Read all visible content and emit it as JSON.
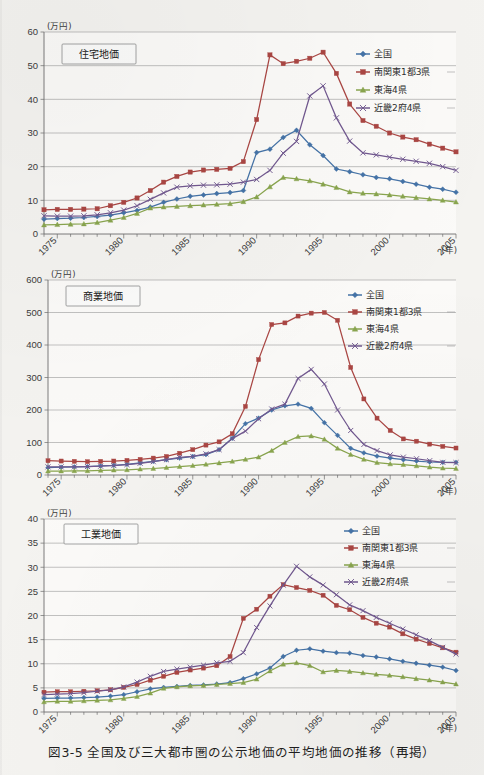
{
  "caption": "図3-5 全国及び三大都市圏の公示地価の平均地価の推移（再掲）",
  "axis_unit_y": "(万円)",
  "axis_unit_x": "(年)",
  "series_names": [
    "全国",
    "南関東1都3県",
    "東海4県",
    "近畿2府4県"
  ],
  "colors": {
    "zenkoku": "#4573a7",
    "minami_kanto": "#aa4643",
    "tokai": "#89a54e",
    "kinki": "#71588f",
    "grid": "#9a9a9a",
    "axis": "#6d6d6d",
    "paper": "#f4f3f0"
  },
  "legend": {
    "items": [
      {
        "label": "全国",
        "color": "#4573a7",
        "marker": "diamond"
      },
      {
        "label": "南関東1都3県",
        "color": "#aa4643",
        "marker": "square"
      },
      {
        "label": "東海4県",
        "color": "#89a54e",
        "marker": "triangle"
      },
      {
        "label": "近畿2府4県",
        "color": "#71588f",
        "marker": "cross"
      }
    ]
  },
  "charts": [
    {
      "id": "residential",
      "panel_label": "住宅地価",
      "ylabel": "(万円)",
      "xlabel": "(年)",
      "ylim": [
        0,
        60
      ],
      "yticks": [
        0,
        10,
        20,
        30,
        40,
        50,
        60
      ],
      "xlim": [
        1974,
        2005
      ],
      "xtick_labels": [
        "1975",
        "1980",
        "1985",
        "1990",
        "1995",
        "2000",
        "2005"
      ],
      "xtick_values": [
        1975,
        1980,
        1985,
        1990,
        1995,
        2000,
        2005
      ]
    },
    {
      "id": "commercial",
      "panel_label": "商業地価",
      "ylabel": "(万円)",
      "xlabel": "(年)",
      "ylim": [
        0,
        600
      ],
      "yticks": [
        0,
        100,
        200,
        300,
        400,
        500,
        600
      ],
      "xlim": [
        1974,
        2005
      ],
      "xtick_labels": [
        "1975",
        "1980",
        "1985",
        "1990",
        "1995",
        "2000",
        "2005"
      ],
      "xtick_values": [
        1975,
        1980,
        1985,
        1990,
        1995,
        2000,
        2005
      ]
    },
    {
      "id": "industrial",
      "panel_label": "工業地価",
      "ylabel": "(万円)",
      "xlabel": "(年)",
      "ylim": [
        0,
        40
      ],
      "yticks": [
        0,
        5,
        10,
        15,
        20,
        25,
        30,
        35,
        40
      ],
      "xlim": [
        1974,
        2005
      ],
      "xtick_labels": [
        "1975",
        "1980",
        "1985",
        "1990",
        "1995",
        "2000",
        "2005"
      ],
      "xtick_values": [
        1975,
        1980,
        1985,
        1990,
        1995,
        2000,
        2005
      ]
    }
  ],
  "chart_data": [
    {
      "type": "line",
      "title": "住宅地価",
      "xlabel": "(年)",
      "ylabel": "(万円)",
      "ylim": [
        0,
        60
      ],
      "grid": true,
      "legend_position": "top-right",
      "x": [
        1974,
        1975,
        1976,
        1977,
        1978,
        1979,
        1980,
        1981,
        1982,
        1983,
        1984,
        1985,
        1986,
        1987,
        1988,
        1989,
        1990,
        1991,
        1992,
        1993,
        1994,
        1995,
        1996,
        1997,
        1998,
        1999,
        2000,
        2001,
        2002,
        2003,
        2004,
        2005
      ],
      "series": [
        {
          "name": "全国",
          "color": "#4573a7",
          "marker": "diamond",
          "values": [
            4.4,
            4.6,
            4.7,
            4.9,
            5.2,
            5.6,
            6.3,
            7.0,
            8.0,
            9.4,
            10.4,
            11.2,
            11.6,
            12.0,
            12.3,
            12.9,
            24.2,
            25.2,
            28.7,
            30.8,
            26.5,
            23.3,
            19.3,
            18.5,
            17.6,
            16.8,
            16.4,
            15.6,
            14.8,
            13.9,
            13.3,
            12.4,
            11.6
          ]
        },
        {
          "name": "南関東1都3県",
          "color": "#aa4643",
          "marker": "square",
          "values": [
            7.2,
            7.3,
            7.3,
            7.4,
            7.5,
            8.4,
            9.4,
            10.7,
            12.9,
            15.4,
            17.1,
            18.4,
            19.0,
            19.2,
            19.5,
            21.5,
            34.0,
            53.2,
            50.6,
            51.3,
            52.2,
            54.0,
            47.7,
            38.6,
            33.7,
            32.0,
            30.0,
            28.8,
            28.0,
            26.7,
            25.5,
            24.4,
            23.4,
            22.4,
            21.5,
            20.6,
            20.2
          ]
        },
        {
          "name": "東海4県",
          "color": "#89a54e",
          "marker": "triangle",
          "values": [
            2.7,
            2.8,
            2.9,
            3.0,
            3.4,
            4.1,
            4.9,
            6.1,
            7.7,
            8.0,
            8.2,
            8.4,
            8.6,
            8.8,
            9.0,
            9.6,
            11.0,
            14.0,
            16.8,
            16.4,
            15.8,
            14.8,
            13.8,
            12.5,
            12.1,
            11.9,
            11.6,
            11.2,
            10.8,
            10.4,
            10.0,
            9.5,
            9.2,
            9.3
          ]
        },
        {
          "name": "近畿2府4県",
          "color": "#71588f",
          "marker": "cross",
          "values": [
            5.4,
            5.3,
            5.3,
            5.4,
            5.7,
            6.3,
            7.1,
            8.4,
            10.3,
            12.2,
            13.9,
            14.3,
            14.5,
            14.6,
            14.8,
            15.4,
            16.2,
            18.9,
            24.0,
            27.5,
            41.0,
            44.0,
            34.5,
            27.6,
            24.1,
            23.5,
            22.8,
            22.2,
            21.6,
            21.0,
            20.0,
            18.9,
            17.7,
            16.5,
            15.2,
            13.8,
            12.5
          ]
        }
      ]
    },
    {
      "type": "line",
      "title": "商業地価",
      "xlabel": "(年)",
      "ylabel": "(万円)",
      "ylim": [
        0,
        600
      ],
      "grid": true,
      "legend_position": "top-right",
      "x": [
        1974,
        1975,
        1976,
        1977,
        1978,
        1979,
        1980,
        1981,
        1982,
        1983,
        1984,
        1985,
        1986,
        1987,
        1988,
        1989,
        1990,
        1991,
        1992,
        1993,
        1994,
        1995,
        1996,
        1997,
        1998,
        1999,
        2000,
        2001,
        2002,
        2003,
        2004,
        2005
      ],
      "series": [
        {
          "name": "全国",
          "color": "#4573a7",
          "marker": "diamond",
          "values": [
            23,
            24,
            25,
            26,
            28,
            30,
            33,
            37,
            42,
            47,
            52,
            57,
            63,
            78,
            113,
            158,
            175,
            200,
            213,
            218,
            205,
            161,
            122,
            82,
            68,
            58,
            52,
            47,
            43,
            40,
            39,
            39,
            37,
            35,
            33
          ]
        },
        {
          "name": "南関東1都3県",
          "color": "#aa4643",
          "marker": "square",
          "values": [
            44,
            43,
            42,
            41,
            42,
            43,
            45,
            48,
            52,
            57,
            67,
            78,
            92,
            102,
            127,
            211,
            355,
            463,
            468,
            489,
            498,
            500,
            476,
            331,
            234,
            175,
            137,
            111,
            104,
            95,
            88,
            83,
            93,
            90,
            88,
            87
          ]
        },
        {
          "name": "東海4県",
          "color": "#89a54e",
          "marker": "triangle",
          "values": [
            12,
            12,
            13,
            13,
            14,
            15,
            16,
            18,
            20,
            23,
            26,
            29,
            33,
            37,
            42,
            48,
            55,
            75,
            100,
            118,
            120,
            110,
            82,
            63,
            48,
            38,
            34,
            32,
            28,
            24,
            21,
            20,
            19,
            18,
            17,
            16
          ]
        },
        {
          "name": "近畿2府4県",
          "color": "#71588f",
          "marker": "cross",
          "values": [
            25,
            25,
            25,
            26,
            27,
            29,
            32,
            36,
            41,
            47,
            54,
            57,
            65,
            78,
            112,
            135,
            173,
            203,
            218,
            297,
            325,
            280,
            200,
            137,
            94,
            75,
            62,
            55,
            50,
            44,
            39,
            38,
            36,
            33,
            30
          ]
        }
      ]
    },
    {
      "type": "line",
      "title": "工業地価",
      "xlabel": "(年)",
      "ylabel": "(万円)",
      "ylim": [
        0,
        40
      ],
      "grid": true,
      "legend_position": "top-right",
      "x": [
        1974,
        1975,
        1976,
        1977,
        1978,
        1979,
        1980,
        1981,
        1982,
        1983,
        1984,
        1985,
        1986,
        1987,
        1988,
        1989,
        1990,
        1991,
        1992,
        1993,
        1994,
        1995,
        1996,
        1997,
        1998,
        1999,
        2000,
        2001,
        2002,
        2003,
        2004,
        2005
      ],
      "series": [
        {
          "name": "全国",
          "color": "#4573a7",
          "marker": "diamond",
          "values": [
            2.8,
            2.9,
            2.9,
            3.0,
            3.1,
            3.3,
            3.6,
            4.2,
            4.8,
            5.1,
            5.3,
            5.5,
            5.6,
            5.8,
            6.1,
            6.9,
            7.9,
            9.1,
            11.5,
            12.8,
            13.1,
            12.6,
            12.3,
            12.2,
            11.7,
            11.4,
            11.0,
            10.5,
            10.1,
            9.7,
            9.3,
            8.6,
            7.9,
            7.2,
            6.5,
            5.8,
            5.5
          ]
        },
        {
          "name": "南関東1都3県",
          "color": "#aa4643",
          "marker": "square",
          "values": [
            4.1,
            4.2,
            4.2,
            4.3,
            4.4,
            4.6,
            5.1,
            5.7,
            6.6,
            7.4,
            8.2,
            8.7,
            9.1,
            9.6,
            11.5,
            19.4,
            21.3,
            24.0,
            26.4,
            25.8,
            25.2,
            24.2,
            22.1,
            21.2,
            19.6,
            18.4,
            17.6,
            16.2,
            15.1,
            14.2,
            13.3,
            12.4,
            11.3,
            10.1,
            9.7
          ]
        },
        {
          "name": "東海4県",
          "color": "#89a54e",
          "marker": "triangle",
          "values": [
            2.1,
            2.2,
            2.2,
            2.3,
            2.4,
            2.5,
            2.8,
            3.2,
            3.9,
            4.9,
            5.2,
            5.4,
            5.5,
            5.7,
            5.9,
            6.1,
            6.8,
            8.5,
            9.9,
            10.2,
            9.6,
            8.3,
            8.6,
            8.4,
            8.1,
            7.8,
            7.6,
            7.3,
            6.9,
            6.6,
            6.2,
            5.8,
            5.4,
            5.1,
            5.0
          ]
        },
        {
          "name": "近畿2府4県",
          "color": "#71588f",
          "marker": "cross",
          "values": [
            3.6,
            3.7,
            3.8,
            4.0,
            4.3,
            4.6,
            5.2,
            6.2,
            7.4,
            8.4,
            8.9,
            9.3,
            9.7,
            10.2,
            10.5,
            12.3,
            17.5,
            22.0,
            26.3,
            30.2,
            28.0,
            26.3,
            24.3,
            22.2,
            21.0,
            19.6,
            18.4,
            17.2,
            16.0,
            14.8,
            13.4,
            12.0,
            10.3,
            8.6,
            7.0,
            6.6
          ]
        }
      ]
    }
  ]
}
